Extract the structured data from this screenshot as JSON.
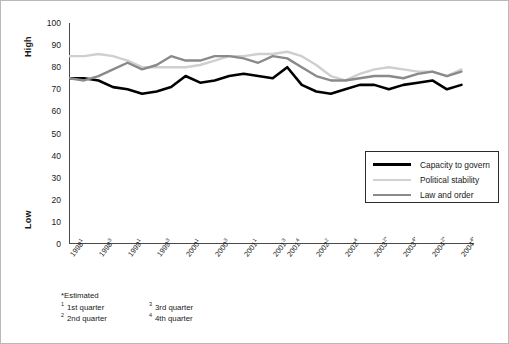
{
  "chart_data": {
    "type": "line",
    "title": "",
    "xlabel": "",
    "ylabel": "",
    "ylim": [
      0,
      100
    ],
    "ytick_step": 10,
    "grid": false,
    "legend_position": "inside-bottom-right",
    "axis_labels": {
      "top": "High",
      "bottom": "Low"
    },
    "yticks": [
      100,
      90,
      80,
      70,
      60,
      50,
      40,
      30,
      20,
      10,
      0
    ],
    "categories": [
      "1998¹",
      "1998²",
      "1998³",
      "1998⁴",
      "1999¹",
      "1999²",
      "1999³",
      "1999⁴",
      "2000¹",
      "2000²",
      "2000³",
      "2000⁴",
      "2001¹",
      "2001²",
      "2001³",
      "2001⁴",
      "2002¹",
      "2002²",
      "2002³",
      "2002⁴",
      "2003¹*",
      "2003²*",
      "2003³*",
      "2003⁴*",
      "2004¹*",
      "2004²*",
      "2004³*",
      "2004⁴*"
    ],
    "xtick_labels_shown": [
      {
        "index": 0,
        "base": "1998",
        "sup": "1"
      },
      {
        "index": 2,
        "base": "1998",
        "sup": "3"
      },
      {
        "index": 4,
        "base": "1999",
        "sup": "1"
      },
      {
        "index": 6,
        "base": "1999",
        "sup": "3"
      },
      {
        "index": 8,
        "base": "2000",
        "sup": "1"
      },
      {
        "index": 10,
        "base": "2000",
        "sup": "3"
      },
      {
        "index": 12,
        "base": "2001",
        "sup": "1"
      },
      {
        "index": 14,
        "base": "2001",
        "sup": "3"
      },
      {
        "index": 15,
        "base": "2001",
        "sup": "4"
      },
      {
        "index": 17,
        "base": "2002",
        "sup": "2"
      },
      {
        "index": 19,
        "base": "2002",
        "sup": "4"
      },
      {
        "index": 21,
        "base": "2003",
        "sup": "2*"
      },
      {
        "index": 23,
        "base": "2003",
        "sup": "4*"
      },
      {
        "index": 25,
        "base": "2004",
        "sup": "2*"
      },
      {
        "index": 27,
        "base": "2004",
        "sup": "4*"
      }
    ],
    "series": [
      {
        "name": "Capacity to govern",
        "color": "#000000",
        "width": 2.6,
        "values": [
          75,
          75,
          74,
          71,
          70,
          68,
          69,
          71,
          76,
          73,
          74,
          76,
          77,
          76,
          75,
          80,
          72,
          69,
          68,
          70,
          72,
          72,
          70,
          72,
          73,
          74,
          70,
          72
        ]
      },
      {
        "name": "Political stability",
        "color": "#cfcfcf",
        "width": 2.4,
        "values": [
          85,
          85,
          86,
          85,
          83,
          80,
          80,
          80,
          80,
          81,
          83,
          85,
          85,
          86,
          86,
          87,
          85,
          81,
          76,
          74,
          77,
          79,
          80,
          79,
          78,
          78,
          76,
          79
        ]
      },
      {
        "name": "Law and order",
        "color": "#8a8a8a",
        "width": 2.4,
        "values": [
          75,
          74,
          76,
          79,
          82,
          79,
          81,
          85,
          83,
          83,
          85,
          85,
          84,
          82,
          85,
          84,
          80,
          76,
          74,
          74,
          75,
          76,
          76,
          75,
          77,
          78,
          76,
          78
        ]
      }
    ]
  },
  "legend": {
    "items": [
      {
        "label": "Capacity to govern",
        "color": "#000000",
        "thickness": "3px"
      },
      {
        "label": "Political stability",
        "color": "#d2d2d2",
        "thickness": "2.5px"
      },
      {
        "label": "Law and order",
        "color": "#8a8a8a",
        "thickness": "2.5px"
      }
    ]
  },
  "footnotes": {
    "estimated": "*Estimated",
    "items": [
      {
        "sup": "1",
        "text": "1st quarter"
      },
      {
        "sup": "2",
        "text": "2nd quarter"
      },
      {
        "sup": "3",
        "text": "3rd quarter"
      },
      {
        "sup": "4",
        "text": "4th quarter"
      }
    ]
  }
}
